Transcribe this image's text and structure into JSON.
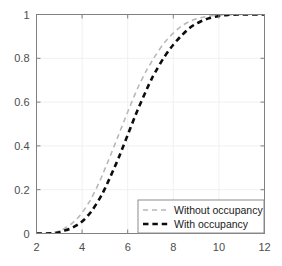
{
  "chart_data": {
    "type": "line",
    "title": "",
    "xlabel": "",
    "ylabel": "",
    "xlim": [
      2,
      12
    ],
    "ylim": [
      0,
      1
    ],
    "xticks": [
      2,
      4,
      6,
      8,
      10,
      12
    ],
    "yticks": [
      0,
      0.2,
      0.4,
      0.6,
      0.8,
      1
    ],
    "xticklabels": [
      "2",
      "4",
      "6",
      "8",
      "10",
      "12"
    ],
    "yticklabels": [
      "0",
      "0.2",
      "0.4",
      "0.6",
      "0.8",
      "1"
    ],
    "grid": true,
    "legend_position": "lower right",
    "series": [
      {
        "name": "Without occupancy",
        "color": "#b8b8b8",
        "linestyle": "dashed",
        "linewidth": 1.6,
        "x": [
          2.0,
          2.4,
          2.8,
          3.0,
          3.2,
          3.6,
          4.0,
          4.4,
          4.8,
          5.0,
          5.2,
          5.6,
          6.0,
          6.4,
          6.8,
          7.0,
          7.2,
          7.6,
          8.0,
          8.4,
          8.8,
          9.2,
          9.6,
          10.0,
          10.4,
          10.8,
          11.2,
          12.0
        ],
        "y": [
          0.0,
          0.0,
          0.005,
          0.012,
          0.022,
          0.05,
          0.095,
          0.16,
          0.245,
          0.295,
          0.345,
          0.45,
          0.555,
          0.655,
          0.74,
          0.775,
          0.81,
          0.87,
          0.915,
          0.95,
          0.972,
          0.985,
          0.993,
          0.997,
          0.999,
          1.0,
          1.0,
          1.0
        ]
      },
      {
        "name": "With occupancy",
        "color": "#0d0d0d",
        "linestyle": "dashed",
        "linewidth": 2.6,
        "x": [
          2.0,
          2.4,
          2.8,
          3.0,
          3.2,
          3.6,
          4.0,
          4.4,
          4.8,
          5.0,
          5.2,
          5.6,
          6.0,
          6.4,
          6.8,
          7.0,
          7.2,
          7.6,
          8.0,
          8.4,
          8.8,
          9.2,
          9.6,
          10.0,
          10.4,
          10.8,
          11.2,
          12.0
        ],
        "y": [
          0.0,
          0.0,
          0.002,
          0.006,
          0.012,
          0.028,
          0.055,
          0.1,
          0.165,
          0.205,
          0.25,
          0.345,
          0.45,
          0.555,
          0.65,
          0.695,
          0.735,
          0.805,
          0.862,
          0.908,
          0.945,
          0.968,
          0.984,
          0.993,
          0.998,
          1.0,
          1.0,
          1.0
        ]
      }
    ]
  },
  "axes": {
    "box_color": "#808080",
    "grid_color": "#f0f0f0",
    "background": "#ffffff"
  },
  "legend": {
    "entries": [
      {
        "label": "Without occupancy",
        "series": 0
      },
      {
        "label": "With occupancy",
        "series": 1
      }
    ],
    "border_color": "#8c8c8c",
    "background": "#ffffff"
  }
}
